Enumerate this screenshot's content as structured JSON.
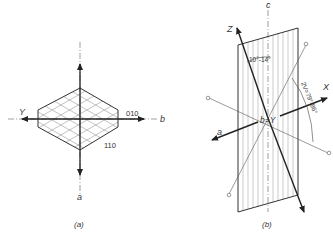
{
  "figure_a": {
    "caption": "(a)",
    "axis_labels": {
      "gamma": "Y",
      "b": "b",
      "a": "a"
    },
    "face_labels": {
      "face_010": "010",
      "face_110": "110"
    }
  },
  "figure_b": {
    "caption": "(b)",
    "axis_labels": {
      "c": "c",
      "z": "Z",
      "x": "X",
      "a": "a",
      "center": "b=Y"
    },
    "angle_labels": {
      "extinction": "10°-14°",
      "optic_angle": "2V=79°-86°"
    }
  },
  "colors": {
    "line": "#333333",
    "hatch": "#8a8a8a",
    "background": "#ffffff"
  }
}
